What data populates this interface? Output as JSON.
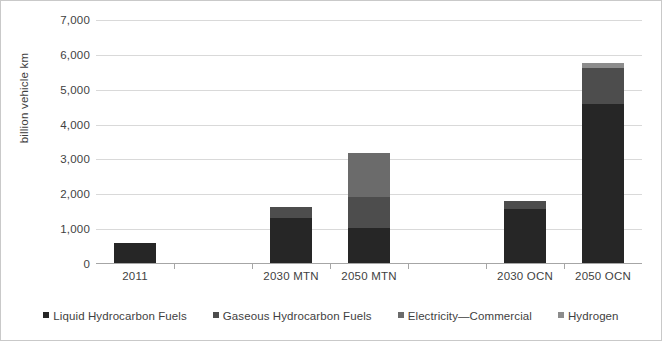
{
  "chart_data": {
    "type": "bar",
    "subtype": "stacked-bar",
    "title": "",
    "xlabel": "",
    "ylabel": "billion vehicle km",
    "ylim": [
      0,
      7000
    ],
    "ytick_step": 1000,
    "ytick_labels": [
      "7,000",
      "6,000",
      "5,000",
      "4,000",
      "3,000",
      "2,000",
      "1,000",
      "0"
    ],
    "ytick_values": [
      7000,
      6000,
      5000,
      4000,
      3000,
      2000,
      1000,
      0
    ],
    "grid": "horizontal",
    "legend_position": "bottom",
    "categories": [
      "2011",
      "",
      "2030 MTN",
      "2050 MTN",
      "",
      "2030 OCN",
      "2050 OCN"
    ],
    "visible_categories": [
      "2011",
      "2030 MTN",
      "2050 MTN",
      "2030 OCN",
      "2050 OCN"
    ],
    "series": [
      {
        "name": "Liquid Hydrocarbon Fuels",
        "color": "#262626",
        "values": [
          580,
          0,
          1280,
          1000,
          0,
          1560,
          4550
        ]
      },
      {
        "name": "Gaseous Hydrocarbon Fuels",
        "color": "#4d4d4d",
        "values": [
          0,
          0,
          340,
          900,
          0,
          230,
          1050
        ]
      },
      {
        "name": "Electricity—Commercial",
        "color": "#6b6b6b",
        "values": [
          0,
          0,
          0,
          1250,
          0,
          0,
          0
        ]
      },
      {
        "name": "Hydrogen",
        "color": "#8c8c8c",
        "values": [
          0,
          0,
          0,
          0,
          0,
          0,
          150
        ]
      }
    ],
    "totals": [
      580,
      0,
      1620,
      3150,
      0,
      1790,
      5750
    ]
  },
  "axis": {
    "y_title": "billion vehicle km"
  },
  "legend": {
    "items": [
      {
        "label": "Liquid Hydrocarbon Fuels",
        "color": "#262626"
      },
      {
        "label": "Gaseous Hydrocarbon Fuels",
        "color": "#4d4d4d"
      },
      {
        "label": "Electricity—Commercial",
        "color": "#6b6b6b"
      },
      {
        "label": "Hydrogen",
        "color": "#8c8c8c"
      }
    ]
  },
  "colors": {
    "gridline": "#d9d9d9",
    "axis": "#a6a6a6",
    "text": "#3f3f3f",
    "background": "#ffffff",
    "border": "#c9c9c9"
  }
}
